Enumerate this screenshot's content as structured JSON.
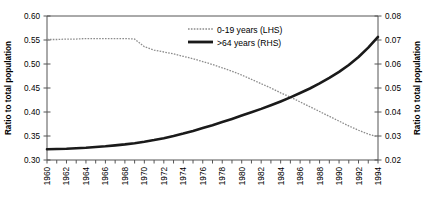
{
  "chart_data": {
    "type": "line",
    "title": "",
    "xlabel": "",
    "ylabel": "Ratio to total population",
    "ylabel_right": "Ratio to total population",
    "grid": false,
    "legend_position": "top-center",
    "xlim": [
      1960,
      1994
    ],
    "ylim": [
      0.3,
      0.6
    ],
    "ylim_right": [
      0.02,
      0.08
    ],
    "x_tick_step": 1,
    "x_label_step": 2,
    "x_tick_labels": [
      "1960",
      "1962",
      "1964",
      "1966",
      "1968",
      "1970",
      "1972",
      "1974",
      "1976",
      "1978",
      "1980",
      "1982",
      "1984",
      "1986",
      "1988",
      "1990",
      "1992",
      "1994"
    ],
    "y_tick_labels_left": [
      "0.30",
      "0.35",
      "0.40",
      "0.45",
      "0.50",
      "0.55",
      "0.60"
    ],
    "y_tick_labels_right": [
      "0.02",
      "0.03",
      "0.04",
      "0.05",
      "0.06",
      "0.07",
      "0.08"
    ],
    "x": [
      1960,
      1961,
      1962,
      1963,
      1964,
      1965,
      1966,
      1967,
      1968,
      1969,
      1970,
      1971,
      1972,
      1973,
      1974,
      1975,
      1976,
      1977,
      1978,
      1979,
      1980,
      1981,
      1982,
      1983,
      1984,
      1985,
      1986,
      1987,
      1988,
      1989,
      1990,
      1991,
      1992,
      1993,
      1994
    ],
    "series": [
      {
        "name": "0-19 years (LHS)",
        "axis": "left",
        "style": "dotted",
        "color": "#8c8c8c",
        "values": [
          0.551,
          0.551,
          0.552,
          0.552,
          0.553,
          0.553,
          0.553,
          0.553,
          0.553,
          0.552,
          0.536,
          0.529,
          0.525,
          0.521,
          0.516,
          0.511,
          0.505,
          0.499,
          0.492,
          0.485,
          0.477,
          0.468,
          0.459,
          0.45,
          0.44,
          0.431,
          0.421,
          0.411,
          0.401,
          0.391,
          0.381,
          0.371,
          0.362,
          0.354,
          0.348
        ]
      },
      {
        "name": ">64 years (RHS)",
        "axis": "right",
        "style": "solid",
        "color": "#1a1a1a",
        "values": [
          0.0245,
          0.0246,
          0.0247,
          0.0249,
          0.0251,
          0.0254,
          0.0257,
          0.0261,
          0.0265,
          0.027,
          0.0276,
          0.0283,
          0.0291,
          0.03,
          0.031,
          0.0321,
          0.0333,
          0.0345,
          0.0358,
          0.0371,
          0.0385,
          0.0399,
          0.0413,
          0.0428,
          0.0444,
          0.0461,
          0.0479,
          0.0498,
          0.0519,
          0.0542,
          0.0567,
          0.0596,
          0.0629,
          0.0668,
          0.0713
        ]
      }
    ]
  },
  "legend": {
    "entries": [
      {
        "label": "0-19 years (LHS)"
      },
      {
        "label": ">64 years (RHS)"
      }
    ]
  }
}
